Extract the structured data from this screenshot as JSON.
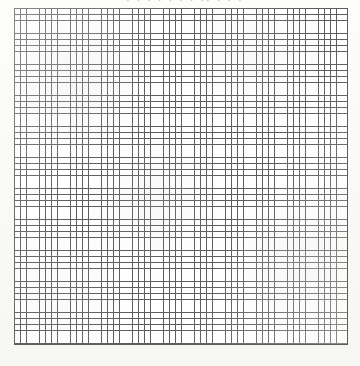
{
  "document": {
    "kind": "scanned graph paper",
    "background_color": "#fbfbf9",
    "width_px": 360,
    "height_px": 366
  },
  "header": {
    "visible": true,
    "clipped": true,
    "text": "· ·   ·  ·   ·  · ·    ·· · ·  ·",
    "color": "#787878",
    "note": "text fragment clipped by the top edge of the scan; not legible"
  },
  "grid": {
    "left_px": 14,
    "top_px": 8,
    "width_px": 334,
    "height_px": 337,
    "columns": 54,
    "rows": 54,
    "cell_size_px": 6.2,
    "line_color": "#5d5d5d",
    "line_width_px": 0.9,
    "cell_fill_color": "#ffffff",
    "has_major_lines": false
  },
  "margins": {
    "left_px": 14,
    "right_px": 12,
    "top_px": 8,
    "bottom_px": 21,
    "color": "#f7f7f5"
  },
  "chart_data": {
    "type": "table",
    "title": "",
    "subtitle": "",
    "xlabel": "",
    "ylabel": "",
    "grid": true,
    "legend": "none",
    "categories": [],
    "values": [],
    "annotations": [],
    "note": "Blank graph paper grid: 54 columns by 54 rows of square cells, no plotted data."
  }
}
